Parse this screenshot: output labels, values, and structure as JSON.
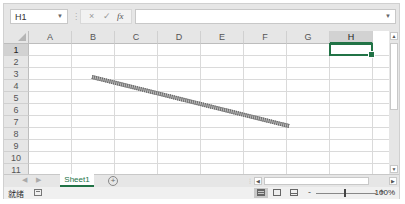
{
  "formula_bar": {
    "name_box": "H1",
    "cancel_icon": "×",
    "enter_icon": "✓",
    "function_icon": "fx",
    "formula_value": ""
  },
  "grid": {
    "columns": [
      "A",
      "B",
      "C",
      "D",
      "E",
      "F",
      "G",
      "H"
    ],
    "rows": [
      "1",
      "2",
      "3",
      "4",
      "5",
      "6",
      "7",
      "8",
      "9",
      "10",
      "11"
    ],
    "active_cell": "H1",
    "selected_column": "H",
    "selected_row": "1"
  },
  "shape": {
    "type": "line",
    "x1": 92,
    "y1": 77,
    "x2": 289,
    "y2": 126
  },
  "sheet_tabs": {
    "tabs": [
      {
        "label": "Sheet1",
        "active": true
      }
    ],
    "add_sheet_icon": "+"
  },
  "status_bar": {
    "status_text": "就绪",
    "zoom_minus": "-",
    "zoom_plus": "+",
    "zoom_level": "100%"
  },
  "colors": {
    "accent": "#217346",
    "header_bg": "#e6e6e6",
    "gridline": "#dadada"
  }
}
